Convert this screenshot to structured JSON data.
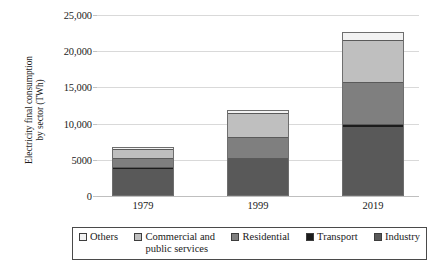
{
  "chart_data": {
    "type": "bar",
    "subtype": "stacked-bar",
    "title": "",
    "xlabel": "",
    "ylabel": "Electricity final consumption by sector (TWh)",
    "ylabel_line1": "Electricity final consumption",
    "ylabel_line2": "by sector (TWh)",
    "categories": [
      "1979",
      "1999",
      "2019"
    ],
    "ylim": [
      0,
      25000
    ],
    "yticks": [
      0,
      5000,
      10000,
      15000,
      20000,
      25000
    ],
    "ytick_labels": [
      "0",
      "5000",
      "10,000",
      "15,000",
      "20,000",
      "25,000"
    ],
    "grid": true,
    "legend_position": "bottom",
    "units": "TWh",
    "series": [
      {
        "name": "Industry",
        "color": "#595959",
        "values": [
          3800,
          5100,
          9500
        ]
      },
      {
        "name": "Transport",
        "color": "#1c1c1c",
        "values": [
          180,
          220,
          400
        ]
      },
      {
        "name": "Residential",
        "color": "#7f7f7f",
        "values": [
          1300,
          2800,
          5800
        ]
      },
      {
        "name": "Commercial and public services",
        "color": "#bfbfbf",
        "values": [
          1200,
          3400,
          5900
        ]
      },
      {
        "name": "Others",
        "color": "#f2f2f2",
        "values": [
          320,
          380,
          1000
        ]
      }
    ],
    "totals": [
      6800,
      11900,
      22600
    ],
    "annotations": []
  },
  "legend": {
    "items": [
      {
        "label": "Others",
        "label_line2": "",
        "color": "#f2f2f2"
      },
      {
        "label": "Commercial and",
        "label_line2": "public services",
        "color": "#bfbfbf"
      },
      {
        "label": "Residential",
        "label_line2": "",
        "color": "#7f7f7f"
      },
      {
        "label": "Transport",
        "label_line2": "",
        "color": "#1c1c1c"
      },
      {
        "label": "Industry",
        "label_line2": "",
        "color": "#595959"
      }
    ]
  }
}
